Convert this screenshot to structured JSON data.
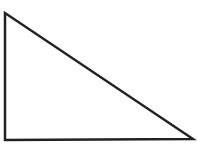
{
  "diagram": {
    "shape": "right-triangle",
    "vertices": {
      "top_left": [
        5,
        13
      ],
      "bottom_left": [
        5,
        140
      ],
      "bottom_right": [
        193,
        139
      ]
    },
    "stroke_color": "#222222",
    "stroke_width": 2.5,
    "fill_color": "#ffffff",
    "background": "#ffffff"
  }
}
